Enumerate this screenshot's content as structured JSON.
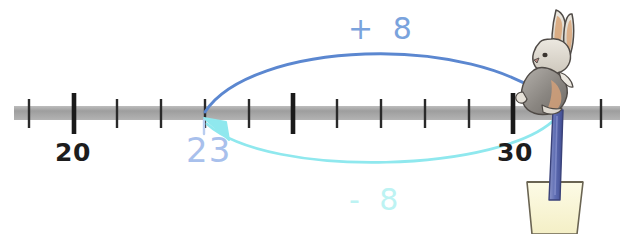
{
  "diagram": {
    "number_line": {
      "axis_color": "#a9a9a9",
      "tick_color": "#1d1d1d",
      "start_x": 14,
      "end_x": 620,
      "axis_y": 113,
      "tick_spacing": 43.8,
      "first_tick_x": 29,
      "tick_count": 14,
      "major_tick_indices": [
        1,
        6,
        11
      ],
      "labels": [
        {
          "text": "20",
          "x": 55,
          "y": 140
        },
        {
          "text": "30",
          "x": 497,
          "y": 140
        }
      ]
    },
    "current_value": {
      "text": "23",
      "color": "#a8c0ec",
      "x": 186,
      "y": 133
    },
    "jump_forward": {
      "label": "+ 8",
      "label_color": "#7aa3dd",
      "arc_color": "#5b87d0",
      "label_x": 348,
      "label_y": 14,
      "from_x": 205,
      "to_x": 557,
      "apex_y": 45
    },
    "jump_backward": {
      "label": "- 8",
      "label_color": "#bdf3f3",
      "arc_color": "#8fe8ee",
      "label_x": 349,
      "label_y": 185,
      "from_x": 557,
      "to_x": 205,
      "dip_y": 178
    },
    "rabbit": {
      "icon_name": "rabbit-illustration",
      "x": 521,
      "y": 6,
      "width": 62,
      "height": 104,
      "body_color": "#8d8a88",
      "head_color": "#ddd8cf",
      "inner_ear_color": "#d9a477",
      "outline_color": "#4f4a46"
    },
    "post": {
      "icon_name": "blue-post",
      "x": 549,
      "y": 110,
      "width": 14,
      "height": 92,
      "color": "#6b79bb",
      "outline_color": "#3d4682"
    },
    "pot": {
      "icon_name": "cream-pot",
      "x": 523,
      "y": 178,
      "width": 62,
      "height": 56,
      "fill_color": "#fbf8d8",
      "outline_color": "#5e5a4a"
    }
  }
}
